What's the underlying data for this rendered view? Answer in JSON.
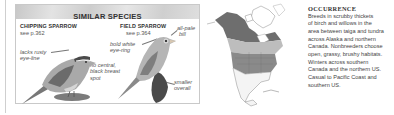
{
  "similar_species": {
    "title": "SIMILAR SPECIES",
    "species": [
      {
        "name": "CHIPPING SPARROW",
        "see": "see p.362",
        "notes": [
          {
            "lines": [
              "lacks rusty",
              "eye-line"
            ]
          },
          {
            "lines": [
              "no central,",
              "black breast",
              "spot"
            ]
          }
        ]
      },
      {
        "name": "FIELD SPARROW",
        "see": "see p.364",
        "notes": [
          {
            "lines": [
              "all-pale",
              "bill"
            ]
          },
          {
            "lines": [
              "bold white",
              "eye-ring"
            ]
          },
          {
            "lines": [
              "smaller",
              "overall"
            ]
          }
        ]
      }
    ]
  },
  "occurrence": {
    "title": "OCCURRENCE",
    "lines": [
      "Breeds in scrubby thickets",
      "of birch and willows in the",
      "area between taiga and tundra",
      "across Alaska and northern",
      "Canada. Nonbreeders choose",
      "open, grassy, brushy habitats.",
      "Winters across southern",
      "Canada and the northern US.",
      "Casual to Pacific Coast and",
      "southern US."
    ]
  },
  "map": {
    "icon": "range-map-north-america",
    "legend_colors": {
      "breeding": "#6e6e6e",
      "migration": "#bdbdbd",
      "winter": "#8a8a8a"
    }
  }
}
